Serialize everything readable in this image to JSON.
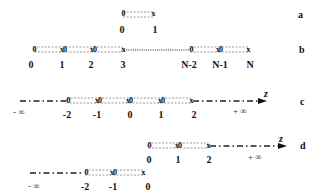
{
  "panels": {
    "a": {
      "tag": "a",
      "labels": [
        "0",
        "1"
      ],
      "nodes": [
        "0",
        "x"
      ]
    },
    "b": {
      "tag": "b",
      "labels": [
        "0",
        "1",
        "2",
        "3",
        "N-2",
        "N-1",
        "N"
      ],
      "nodes": [
        "0",
        "x0",
        "x0",
        "x",
        "0",
        "x0",
        "x"
      ]
    },
    "c": {
      "tag": "c",
      "labels": [
        "-2",
        "-1",
        "0",
        "1",
        "2"
      ],
      "nodes": [
        "0",
        "x0",
        "x0",
        "x0",
        "x"
      ],
      "minus_inf": "- ∞",
      "plus_inf": "+ ∞",
      "axis": "z"
    },
    "d": {
      "tag": "d",
      "upper_labels": [
        "0",
        "1",
        "2"
      ],
      "upper_nodes": [
        "0",
        "x0",
        "x"
      ],
      "lower_labels": [
        "-2",
        "-1",
        "0"
      ],
      "lower_nodes": [
        "0",
        "x0",
        "x"
      ],
      "minus_inf": "- ∞",
      "plus_inf": "+ ∞",
      "axis": "z"
    }
  }
}
